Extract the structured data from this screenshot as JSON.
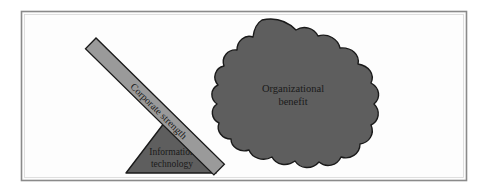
{
  "figure": {
    "frame": {
      "border_color": "#8a8a8a",
      "background_color": "#fdfdfd"
    },
    "colors": {
      "lever_fill": "#9a9a9a",
      "lever_stroke": "#1a1a1a",
      "triangle_fill": "#5e5e5e",
      "triangle_stroke": "#1a1a1a",
      "blob_fill": "#5e5e5e",
      "blob_stroke": "#1a1a1a",
      "text": "#1a1a1a"
    },
    "shapes": {
      "lever": {
        "name": "lever-bar",
        "label": "Corporate strength",
        "rotation_deg": 45
      },
      "fulcrum": {
        "name": "fulcrum-triangle",
        "label_line_1": "Information",
        "label_line_2": "technology"
      },
      "outcome": {
        "name": "benefit-blob",
        "label_line_1": "Organizational",
        "label_line_2": "benefit"
      }
    }
  }
}
